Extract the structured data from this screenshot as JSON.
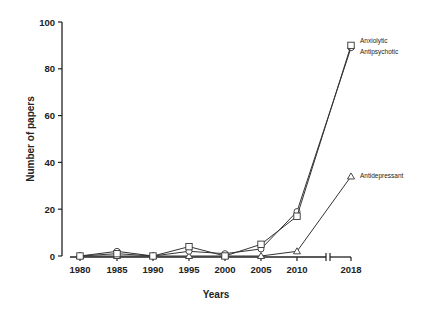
{
  "chart_data": {
    "type": "line",
    "title": "",
    "xlabel": "Years",
    "ylabel": "Number of papers",
    "x": [
      "1980",
      "1985",
      "1990",
      "1995",
      "2000",
      "2005",
      "2010",
      "2018"
    ],
    "axis_break": "between 2010 and 2018",
    "ylim": [
      0,
      100
    ],
    "yticks": [
      0,
      20,
      40,
      60,
      80,
      100
    ],
    "grid": false,
    "series": [
      {
        "name": "Anxiolytic",
        "marker": "square",
        "values": [
          0,
          1,
          0,
          4,
          0,
          5,
          17,
          90
        ]
      },
      {
        "name": "Antipsychotic",
        "marker": "circle",
        "values": [
          0,
          2,
          0,
          2,
          1,
          3,
          19,
          89
        ]
      },
      {
        "name": "Antidepressant",
        "marker": "triangle",
        "values": [
          0,
          0,
          0,
          0,
          0,
          0,
          2,
          34
        ]
      }
    ],
    "legend": "inline labels at line ends (right)"
  }
}
